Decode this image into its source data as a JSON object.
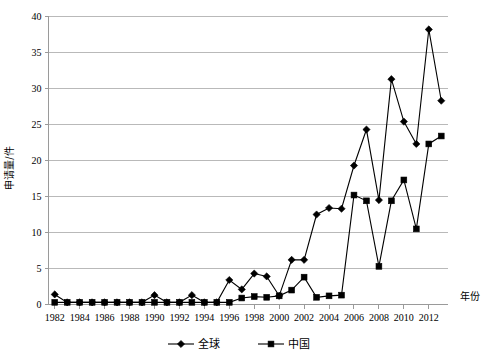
{
  "chart_data": {
    "type": "line",
    "title": "",
    "xlabel": "年份",
    "ylabel": "申请量/件",
    "ylim": [
      0,
      40
    ],
    "ytick_step": 5,
    "yticks": [
      "0",
      "5",
      "10",
      "15",
      "20",
      "25",
      "30",
      "35",
      "40"
    ],
    "grid": true,
    "legend_position": "bottom",
    "x": [
      1982,
      1983,
      1984,
      1985,
      1986,
      1987,
      1988,
      1989,
      1990,
      1991,
      1992,
      1993,
      1994,
      1995,
      1996,
      1997,
      1998,
      1999,
      2000,
      2001,
      2002,
      2003,
      2004,
      2005,
      2006,
      2007,
      2008,
      2009,
      2010,
      2011,
      2012,
      2013
    ],
    "xtick_labels": [
      "1982",
      "1984",
      "1986",
      "1988",
      "1990",
      "1992",
      "1994",
      "1996",
      "1998",
      "2000",
      "2002",
      "2004",
      "2006",
      "2008",
      "2010",
      "2012"
    ],
    "series": [
      {
        "name": "全球",
        "marker": "diamond",
        "values": [
          1.4,
          0.3,
          0.3,
          0.3,
          0.3,
          0.3,
          0.3,
          0.3,
          1.3,
          0.3,
          0.3,
          1.3,
          0.3,
          0.3,
          3.4,
          2.1,
          4.3,
          3.9,
          1.2,
          6.2,
          6.2,
          12.5,
          13.4,
          13.3,
          19.3,
          24.3,
          14.5,
          31.3,
          25.4,
          22.3,
          38.2,
          28.3
        ]
      },
      {
        "name": "中国",
        "marker": "square",
        "values": [
          0.3,
          0.3,
          0.3,
          0.3,
          0.3,
          0.3,
          0.3,
          0.3,
          0.3,
          0.3,
          0.3,
          0.3,
          0.3,
          0.3,
          0.3,
          0.9,
          1.1,
          1.0,
          1.2,
          2.0,
          3.8,
          1.0,
          1.2,
          1.3,
          15.2,
          14.4,
          5.3,
          14.4,
          17.3,
          10.5,
          22.3,
          23.4
        ]
      }
    ]
  },
  "legend": {
    "items": [
      {
        "label": "全球",
        "marker": "diamond"
      },
      {
        "label": "中国",
        "marker": "square"
      }
    ]
  },
  "axes": {
    "y_title": "申请量/件",
    "x_title": "年份"
  }
}
